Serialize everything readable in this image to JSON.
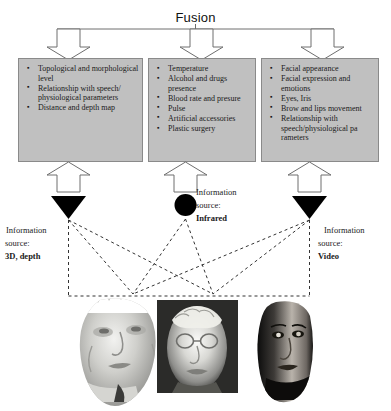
{
  "diagram": {
    "title": "Fusion",
    "type": "multimodal-biometric-fusion-diagram",
    "accent_colors": {
      "box_fill": "#c0c0c0",
      "box_border": "#8a8a8a",
      "arrow_fill": "#ffffff",
      "arrow_stroke": "#6e6e6e",
      "sensor_fill": "#000000",
      "dashed_line": "#333333"
    },
    "feature_boxes": [
      {
        "id": "3d-depth",
        "items": [
          "Topological and morphological level",
          "Relationship with speech/ physiological parameters",
          "Distance and depth map"
        ]
      },
      {
        "id": "infrared",
        "items": [
          "Temperature",
          "Alcohol and drugs presence",
          "Blood rate and presure",
          "Pulse",
          "Artificial accessories",
          "Plastic surgery"
        ]
      },
      {
        "id": "video",
        "items": [
          "Facial appearance",
          "Facial expression and emotions",
          "Eyes, Iris",
          "Brow and lips movement",
          "Relationship with speech/physiological pa rameters"
        ]
      }
    ],
    "information_sources": [
      {
        "id": "3d-depth",
        "line1": "Information",
        "line2": "source:",
        "kind": "3D, depth",
        "sensor_icon": "triangle-down-sensor-icon"
      },
      {
        "id": "infrared",
        "line1": "Information",
        "line2": "source:",
        "kind": "Infrared",
        "sensor_icon": "circle-sensor-icon"
      },
      {
        "id": "video",
        "line1": "Information",
        "line2": "source:",
        "kind": "Video",
        "sensor_icon": "triangle-down-sensor-icon"
      }
    ],
    "sample_images": [
      {
        "id": "face-3d-mesh",
        "modality": "3D, depth"
      },
      {
        "id": "face-thermal",
        "modality": "Infrared"
      },
      {
        "id": "face-video",
        "modality": "Video"
      }
    ]
  }
}
